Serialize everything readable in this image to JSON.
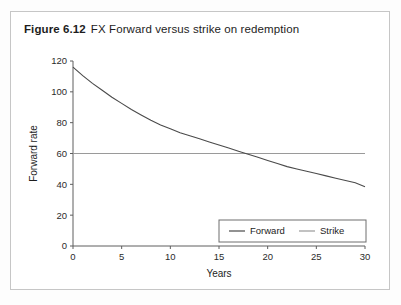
{
  "figure": {
    "number": "Figure 6.12",
    "caption": "FX Forward versus strike on redemption"
  },
  "colors": {
    "forward_line": "#4a4a4a",
    "strike_line": "#9a9a9a",
    "axis": "#5e5e5e",
    "frame_border": "#c6c6c6",
    "card_background": "#ffffff",
    "page_background": "#fdfdfd"
  },
  "chart_data": {
    "type": "line",
    "title": "FX Forward versus strike on redemption",
    "xlabel": "Years",
    "ylabel": "Forward rate",
    "xlim": [
      0,
      30
    ],
    "ylim": [
      0,
      120
    ],
    "xticks": [
      0,
      5,
      10,
      15,
      20,
      25,
      30
    ],
    "yticks": [
      0,
      20,
      40,
      60,
      80,
      100,
      120
    ],
    "xtick_labels": [
      "0",
      "5",
      "10",
      "15",
      "20",
      "25",
      "30"
    ],
    "ytick_labels": [
      "0",
      "20",
      "40",
      "60",
      "80",
      "100",
      "120"
    ],
    "grid": false,
    "legend_position": "lower right",
    "x": [
      0,
      1,
      2,
      3,
      4,
      5,
      6,
      7,
      8,
      9,
      10,
      11,
      12,
      13,
      14,
      15,
      16,
      17,
      18,
      19,
      20,
      21,
      22,
      23,
      24,
      25,
      26,
      27,
      28,
      29,
      30
    ],
    "series": [
      {
        "name": "Forward",
        "color": "#4a4a4a",
        "values": [
          116,
          110.5,
          105.5,
          101,
          96.5,
          92.5,
          88.5,
          85,
          81.5,
          78.5,
          76,
          73.5,
          71.5,
          69.5,
          67.5,
          65.5,
          63.5,
          61.5,
          59.5,
          57.5,
          55.5,
          53.5,
          51.5,
          50,
          48.5,
          47,
          45.5,
          44,
          42.5,
          41,
          38.5
        ]
      },
      {
        "name": "Strike",
        "color": "#9a9a9a",
        "values": [
          60,
          60,
          60,
          60,
          60,
          60,
          60,
          60,
          60,
          60,
          60,
          60,
          60,
          60,
          60,
          60,
          60,
          60,
          60,
          60,
          60,
          60,
          60,
          60,
          60,
          60,
          60,
          60,
          60,
          60,
          60
        ]
      }
    ],
    "annotations": [
      {
        "text": "Forward curve crosses strike near year 18",
        "x": 18,
        "y": 60
      }
    ]
  },
  "legend": {
    "items": [
      {
        "label": "Forward",
        "color": "#4a4a4a"
      },
      {
        "label": "Strike",
        "color": "#9a9a9a"
      }
    ]
  }
}
